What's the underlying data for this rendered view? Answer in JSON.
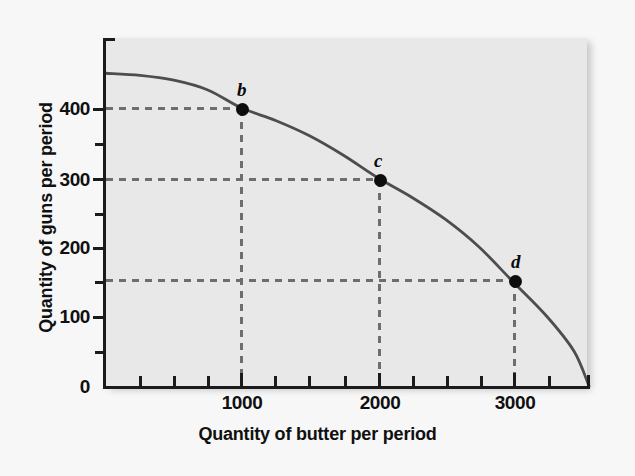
{
  "figure": {
    "background_color": "#f7f7f7",
    "panel_color": "#e8e8e8",
    "curve_color": "#4d4d4d",
    "guide_color": "#6e6e6e",
    "point_color": "#0d0d0d",
    "axis_color": "#1b1b1b"
  },
  "chart_data": {
    "type": "line",
    "title": "",
    "subtitle": "",
    "xlabel": "Quantity of butter per period",
    "ylabel": "Quantity of guns per period",
    "xlim": [
      0,
      3560
    ],
    "ylim": [
      0,
      500
    ],
    "grid": false,
    "legend": null,
    "x_major_ticks": [
      1000,
      2000,
      3000
    ],
    "x_major_tick_labels": [
      "1000",
      "2000",
      "3000"
    ],
    "x_minor_ticks": [
      250,
      500,
      750,
      1250,
      1500,
      1750,
      2250,
      2500,
      2750,
      3250,
      3500
    ],
    "y_major_ticks": [
      0,
      100,
      200,
      300,
      400
    ],
    "y_major_tick_labels": [
      "0",
      "100",
      "200",
      "300",
      "400"
    ],
    "y_minor_ticks": [
      50,
      150,
      250,
      350,
      450
    ],
    "series": [
      {
        "name": "Production possibilities frontier",
        "style": "solid",
        "x": [
          0,
          250,
          500,
          750,
          1000,
          1250,
          1500,
          1750,
          2000,
          2250,
          2500,
          2750,
          3000,
          3250,
          3450,
          3560
        ],
        "y": [
          450,
          447,
          440,
          426,
          400,
          382,
          360,
          332,
          300,
          272,
          240,
          200,
          150,
          100,
          50,
          0
        ]
      }
    ],
    "points": [
      {
        "label": "b",
        "x": 1000,
        "y": 400
      },
      {
        "label": "c",
        "x": 2000,
        "y": 300
      },
      {
        "label": "d",
        "x": 3000,
        "y": 150
      }
    ],
    "guide_lines": [
      {
        "orientation": "horizontal",
        "value": 400,
        "from": 0,
        "to": 1000
      },
      {
        "orientation": "horizontal",
        "value": 300,
        "from": 0,
        "to": 2000
      },
      {
        "orientation": "horizontal",
        "value": 150,
        "from": 0,
        "to": 3000
      },
      {
        "orientation": "vertical",
        "value": 1000,
        "from": 0,
        "to": 400
      },
      {
        "orientation": "vertical",
        "value": 2000,
        "from": 0,
        "to": 300
      },
      {
        "orientation": "vertical",
        "value": 3000,
        "from": 0,
        "to": 150
      }
    ]
  },
  "axis": {
    "x_title": "Quantity of butter per period",
    "y_title": "Quantity of guns per period",
    "y_tick_labels": [
      "400",
      "300",
      "200",
      "100",
      "0"
    ],
    "x_tick_labels": [
      "1000",
      "2000",
      "3000"
    ]
  },
  "point_labels": {
    "b": "b",
    "c": "c",
    "d": "d"
  }
}
